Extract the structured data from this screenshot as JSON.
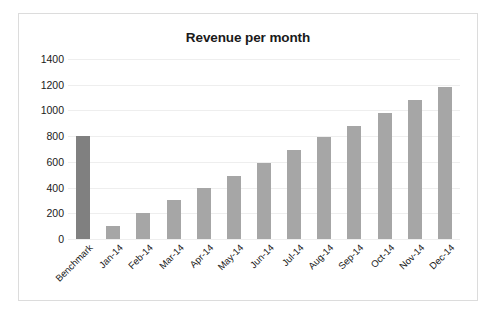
{
  "chart_data": {
    "type": "bar",
    "title": "Revenue per month",
    "xlabel": "",
    "ylabel": "",
    "ylim": [
      0,
      1400
    ],
    "ytick_step": 200,
    "yticks": [
      1400,
      1200,
      1000,
      800,
      600,
      400,
      200,
      0
    ],
    "grid": true,
    "legend": null,
    "categories": [
      "Benchmark",
      "Jan-14",
      "Feb-14",
      "Mar-14",
      "Apr-14",
      "May-14",
      "Jun-14",
      "Jul-14",
      "Aug-14",
      "Sep-14",
      "Oct-14",
      "Nov-14",
      "Dec-14"
    ],
    "values": [
      800,
      100,
      200,
      300,
      400,
      490,
      590,
      690,
      790,
      880,
      980,
      1080,
      1180
    ],
    "bar_colors": [
      "#808080",
      "#a6a6a6",
      "#a6a6a6",
      "#a6a6a6",
      "#a6a6a6",
      "#a6a6a6",
      "#a6a6a6",
      "#a6a6a6",
      "#a6a6a6",
      "#a6a6a6",
      "#a6a6a6",
      "#a6a6a6",
      "#a6a6a6"
    ]
  },
  "colors": {
    "background": "#ffffff",
    "border": "#dcdcdc",
    "gridline": "#eeeeee",
    "text": "#1a1a1a",
    "bar_default": "#a6a6a6",
    "bar_benchmark": "#808080"
  }
}
